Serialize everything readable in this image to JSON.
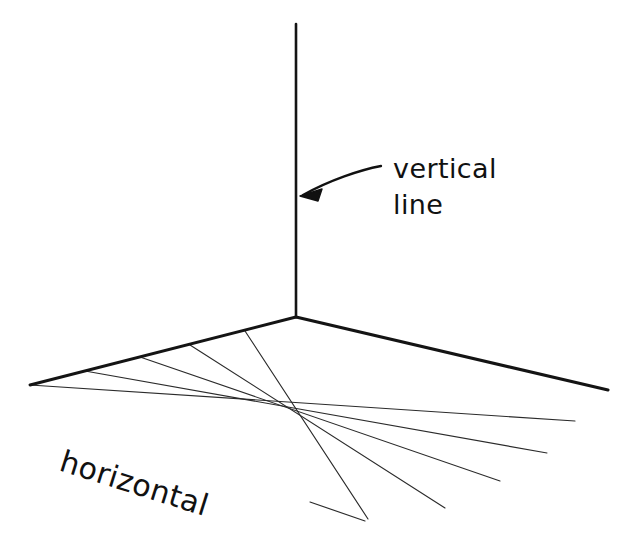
{
  "canvas": {
    "width": 637,
    "height": 545,
    "background": "#ffffff",
    "ink_color": "#141414",
    "fan_color": "#2b2b2b"
  },
  "labels": {
    "vertical_line_1": "vertical",
    "vertical_line_2": "line",
    "horizontal": "horizontal"
  },
  "geometry": {
    "vertex": {
      "x": 296,
      "y": 317
    },
    "vertical_line": {
      "name": "vertical-line",
      "x1": 296,
      "y1": 24,
      "x2": 296,
      "y2": 317,
      "stroke_width": 2.6
    },
    "back_left_edge": {
      "name": "back-left-edge",
      "x1": 296,
      "y1": 317,
      "x2": 30,
      "y2": 385,
      "stroke_width": 2.9
    },
    "back_right_edge": {
      "name": "back-right-edge",
      "x1": 296,
      "y1": 317,
      "x2": 608,
      "y2": 390,
      "stroke_width": 3.1
    },
    "fan_lines": [
      {
        "x1": 30,
        "y1": 385,
        "x2": 575,
        "y2": 421
      },
      {
        "x1": 85,
        "y1": 371,
        "x2": 547,
        "y2": 453
      },
      {
        "x1": 140,
        "y1": 357,
        "x2": 500,
        "y2": 481
      },
      {
        "x1": 190,
        "y1": 345,
        "x2": 445,
        "y2": 508
      },
      {
        "x1": 245,
        "y1": 331,
        "x2": 368,
        "y2": 519
      }
    ],
    "fan_short_mark": {
      "x1": 310,
      "y1": 502,
      "x2": 365,
      "y2": 521
    },
    "arrow": {
      "name": "vertical-line-pointer",
      "path": "M 381 166 C 360 170, 330 180, 303 195",
      "tip": {
        "x": 300,
        "y": 196
      },
      "head_points": "300,196 322,189 318,201"
    }
  },
  "text_placement": {
    "vertical_label": {
      "x": 393,
      "y": 178,
      "line2_y": 214,
      "rotation": 0
    },
    "horizontal_label": {
      "x": 58,
      "y": 470,
      "rotation": 17.5
    }
  }
}
